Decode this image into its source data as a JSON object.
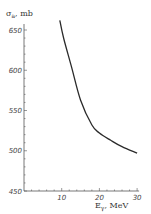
{
  "chart_data": {
    "type": "line",
    "title": "",
    "xlabel": "E_γ, MeV",
    "ylabel": "σ_a, mb",
    "xlim": [
      0,
      30
    ],
    "ylim": [
      450,
      665
    ],
    "x_ticks": [
      10,
      20,
      30
    ],
    "y_ticks": [
      450,
      500,
      550,
      600,
      650
    ],
    "grid": false,
    "legend": null,
    "series": [
      {
        "name": "σ_a",
        "x": [
          9.5,
          10.5,
          12.5,
          15,
          18,
          20,
          23,
          26,
          30
        ],
        "y": [
          662,
          640,
          606,
          563,
          532,
          522,
          513,
          505,
          497
        ]
      }
    ]
  },
  "labels": {
    "ylabel_main": "σ",
    "ylabel_sub": "a",
    "ylabel_unit": ", mb",
    "xlabel_main": "E",
    "xlabel_sub": "γ",
    "xlabel_unit": ", MeV"
  },
  "colors": {
    "line": "#2a2a2a",
    "axis": "#555555",
    "text": "#444444"
  }
}
